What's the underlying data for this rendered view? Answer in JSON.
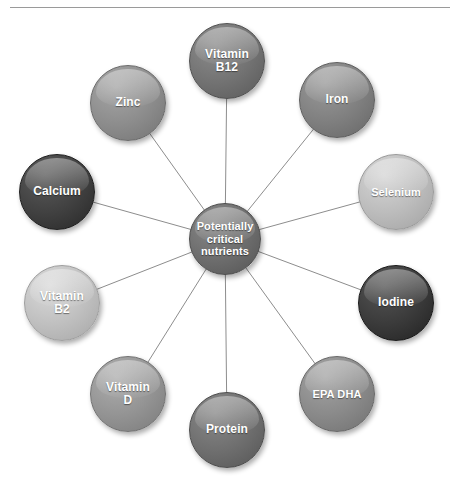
{
  "diagram": {
    "title": "Potentially critical nutrients",
    "type": "radial hub-and-spoke",
    "center": {
      "label": "Potentially\ncritical\nnutrients",
      "line1": "Potentially",
      "line2": "critical",
      "line3": "nutrients",
      "color": "#6e6e6e",
      "cx": 225,
      "cy": 239,
      "r": 36
    },
    "nodes": [
      {
        "id": "vitamin-b12",
        "label": "Vitamin B12",
        "line1": "Vitamin",
        "line2": "B12",
        "color": "#737373",
        "cx": 227,
        "cy": 61,
        "r": 38,
        "font_size": 12
      },
      {
        "id": "iron",
        "label": "Iron",
        "line1": "Iron",
        "line2": "",
        "color": "#808080",
        "cx": 337,
        "cy": 100,
        "r": 38,
        "font_size": 12
      },
      {
        "id": "selenium",
        "label": "Selenium",
        "line1": "Selenium",
        "line2": "",
        "color": "#bcbcbc",
        "cx": 396,
        "cy": 192,
        "r": 38,
        "font_size": 11
      },
      {
        "id": "iodine",
        "label": "Iodine",
        "line1": "Iodine",
        "line2": "",
        "color": "#3b3b3b",
        "cx": 396,
        "cy": 303,
        "r": 38,
        "font_size": 12
      },
      {
        "id": "epa-dha",
        "label": "EPA  DHA",
        "line1": "EPA  DHA",
        "line2": "",
        "color": "#8a8a8a",
        "cx": 337,
        "cy": 394,
        "r": 38,
        "font_size": 11
      },
      {
        "id": "protein",
        "label": "Protein",
        "line1": "Protein",
        "line2": "",
        "color": "#6f6f6f",
        "cx": 227,
        "cy": 430,
        "r": 38,
        "font_size": 12
      },
      {
        "id": "vitamin-d",
        "label": "Vitamin D",
        "line1": "Vitamin",
        "line2": "D",
        "color": "#949494",
        "cx": 128,
        "cy": 394,
        "r": 38,
        "font_size": 12
      },
      {
        "id": "vitamin-b2",
        "label": "Vitamin B2",
        "line1": "Vitamin",
        "line2": "B2",
        "color": "#c0c0c0",
        "cx": 62,
        "cy": 303,
        "r": 38,
        "font_size": 12
      },
      {
        "id": "calcium",
        "label": "Calcium",
        "line1": "Calcium",
        "line2": "",
        "color": "#414141",
        "cx": 57,
        "cy": 192,
        "r": 38,
        "font_size": 12
      },
      {
        "id": "zinc",
        "label": "Zinc",
        "line1": "Zinc",
        "line2": "",
        "color": "#8d8d8d",
        "cx": 128,
        "cy": 103,
        "r": 38,
        "font_size": 12
      }
    ],
    "connector_color": "#8d8d8d",
    "rule_color": "#9a9a9a",
    "background": "#ffffff"
  }
}
